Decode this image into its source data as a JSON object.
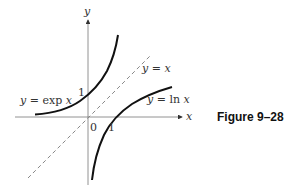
{
  "figure": {
    "caption": "Figure 9–28",
    "axes": {
      "x_label": "x",
      "y_label": "y",
      "origin_label": "0",
      "x_tick_label": "1",
      "y_tick_label": "1"
    },
    "curves": [
      {
        "name": "exp",
        "label": "y = exp x",
        "label_parts": {
          "y": "y",
          "eq": " = ",
          "fn": "exp ",
          "arg": "x"
        },
        "style": "solid",
        "color": "#111111"
      },
      {
        "name": "ln",
        "label": "y = ln x",
        "label_parts": {
          "y": "y",
          "eq": " = ",
          "fn": "ln ",
          "arg": "x"
        },
        "style": "solid",
        "color": "#111111"
      },
      {
        "name": "identity",
        "label": "y = x",
        "label_parts": {
          "y": "y",
          "eq": " = ",
          "arg": "x"
        },
        "style": "dashed",
        "color": "#888888"
      }
    ]
  }
}
